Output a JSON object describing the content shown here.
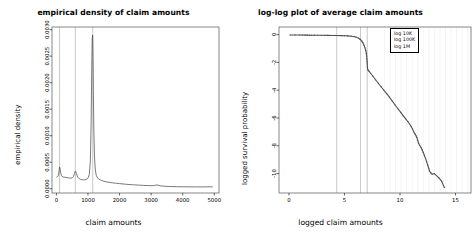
{
  "figure": {
    "width": 454,
    "height": 233,
    "background": "#ffffff",
    "foreground": "#000000",
    "curve_color": "#4d4d4d",
    "refline_color": "#b0b0b0",
    "grid_color": "#e8e8e8"
  },
  "panels": [
    {
      "id": "density-panel",
      "title": "empirical density of claim amounts",
      "xlabel": "claim amounts",
      "ylabel": "empirical density"
    },
    {
      "id": "loglog-panel",
      "title": "log-log plot of average claim amounts",
      "xlabel": "logged claim amounts",
      "ylabel": "logged survival probability",
      "legend": {
        "items": [
          "log 10K",
          "log 100K",
          "log 1M"
        ]
      }
    }
  ],
  "chart_data": [
    {
      "type": "line",
      "id": "density-panel",
      "title": "empirical density of claim amounts",
      "xlabel": "claim amounts",
      "ylabel": "empirical density",
      "xlim": [
        -140,
        5150
      ],
      "ylim": [
        -8e-05,
        0.00305
      ],
      "xticks": [
        0,
        1000,
        2000,
        3000,
        4000,
        5000
      ],
      "xticklabels": [
        "0",
        "1000",
        "2000",
        "3000",
        "4000",
        "5000"
      ],
      "yticks": [
        0.0,
        0.0005,
        0.001,
        0.0015,
        0.002,
        0.0025,
        0.003
      ],
      "yticklabels": [
        "0.0000",
        "0.0005",
        "0.0010",
        "0.0015",
        "0.0020",
        "0.0025",
        "0.0030"
      ],
      "grid": false,
      "legend_position": "none",
      "reference_lines_x": [
        100,
        600,
        1150
      ],
      "series": [
        {
          "name": "empirical density",
          "x": [
            0,
            30,
            55,
            75,
            90,
            100,
            110,
            125,
            140,
            160,
            185,
            210,
            240,
            270,
            300,
            340,
            380,
            420,
            460,
            500,
            540,
            570,
            590,
            600,
            615,
            635,
            660,
            690,
            720,
            760,
            800,
            850,
            900,
            950,
            1000,
            1040,
            1075,
            1100,
            1118,
            1132,
            1145,
            1152,
            1160,
            1170,
            1185,
            1205,
            1230,
            1260,
            1300,
            1350,
            1420,
            1500,
            1600,
            1700,
            1800,
            1900,
            2000,
            2150,
            2300,
            2450,
            2600,
            2750,
            2900,
            3000,
            3080,
            3140,
            3180,
            3220,
            3280,
            3400,
            3600,
            3800,
            4000,
            4200,
            4400,
            4600,
            4800,
            4950
          ],
          "y": [
            0.000215,
            0.000225,
            0.000245,
            0.0003,
            0.00037,
            0.00041,
            0.000395,
            0.00034,
            0.00029,
            0.000248,
            0.000228,
            0.00022,
            0.000218,
            0.000216,
            0.000214,
            0.00021,
            0.000206,
            0.000202,
            0.0002,
            0.000205,
            0.00023,
            0.000285,
            0.000325,
            0.000333,
            0.00032,
            0.000282,
            0.00024,
            0.000208,
            0.00019,
            0.000178,
            0.000172,
            0.000168,
            0.000168,
            0.000176,
            0.0002,
            0.000265,
            0.00052,
            0.00125,
            0.0022,
            0.00282,
            0.0029,
            0.00283,
            0.0025,
            0.00185,
            0.00112,
            0.00062,
            0.00037,
            0.000255,
            0.000205,
            0.00018,
            0.000158,
            0.000142,
            0.000128,
            0.000118,
            0.00011,
            0.000103,
            9.7e-05,
            8.8e-05,
            8e-05,
            7.4e-05,
            6.9e-05,
            6.4e-05,
            6e-05,
            5.8e-05,
            6e-05,
            6.8e-05,
            7.2e-05,
            6.6e-05,
            5.6e-05,
            4.8e-05,
            4.2e-05,
            3.9e-05,
            3.7e-05,
            3.6e-05,
            3.5e-05,
            3.5e-05,
            3.6e-05,
            3.7e-05
          ]
        }
      ]
    },
    {
      "type": "scatter",
      "id": "loglog-panel",
      "title": "log-log plot of average claim amounts",
      "xlabel": "logged claim amounts",
      "ylabel": "logged survival probability",
      "xlim": [
        -0.9,
        16.4
      ],
      "ylim": [
        -11.4,
        0.55
      ],
      "xticks": [
        0,
        5,
        10,
        15
      ],
      "xticklabels": [
        "0",
        "5",
        "10",
        "15"
      ],
      "yticks": [
        0,
        -2,
        -4,
        -6,
        -8,
        -10
      ],
      "yticklabels": [
        "0",
        "-2",
        "-4",
        "-6",
        "-8",
        "-10"
      ],
      "grid": true,
      "legend_position": "top-right",
      "legend_entries": [
        "log 10K",
        "log 100K",
        "log 1M"
      ],
      "reference_lines_x": [
        4.3,
        6.45,
        7.05
      ],
      "series": [
        {
          "name": "logged survival probability",
          "x": [
            0.1,
            0.55,
            0.95,
            1.2,
            1.45,
            1.65,
            1.85,
            2.05,
            2.3,
            2.6,
            2.9,
            3.2,
            3.5,
            3.8,
            4.1,
            4.4,
            4.7,
            5.0,
            5.3,
            5.6,
            5.85,
            6.05,
            6.25,
            6.4,
            6.55,
            6.65,
            6.75,
            6.85,
            6.92,
            6.97,
            7.0,
            7.02,
            7.04,
            7.05,
            7.06,
            7.08,
            7.12,
            7.2,
            7.35,
            7.55,
            7.8,
            8.05,
            8.3,
            8.55,
            8.8,
            9.05,
            9.3,
            9.55,
            9.8,
            10.05,
            10.3,
            10.5,
            10.7,
            10.85,
            11.0,
            11.12,
            11.25,
            11.35,
            11.45,
            11.52,
            11.6,
            11.68,
            11.78,
            11.9,
            12.0,
            12.1,
            12.2,
            12.3,
            12.4,
            12.5,
            12.6,
            12.68,
            12.78,
            12.9,
            13.1,
            13.55,
            13.75,
            14.0
          ],
          "y": [
            -0.02,
            -0.025,
            -0.03,
            -0.032,
            -0.034,
            -0.036,
            -0.038,
            -0.04,
            -0.042,
            -0.045,
            -0.048,
            -0.05,
            -0.053,
            -0.056,
            -0.06,
            -0.064,
            -0.07,
            -0.078,
            -0.09,
            -0.11,
            -0.14,
            -0.18,
            -0.25,
            -0.33,
            -0.45,
            -0.58,
            -0.75,
            -0.95,
            -1.15,
            -1.35,
            -1.55,
            -1.75,
            -1.95,
            -2.1,
            -2.3,
            -2.45,
            -2.55,
            -2.62,
            -2.78,
            -2.98,
            -3.25,
            -3.5,
            -3.75,
            -4.0,
            -4.25,
            -4.5,
            -4.78,
            -5.05,
            -5.32,
            -5.58,
            -5.85,
            -6.05,
            -6.25,
            -6.42,
            -6.6,
            -6.78,
            -7.0,
            -7.15,
            -7.28,
            -7.4,
            -7.62,
            -7.82,
            -7.98,
            -8.12,
            -8.3,
            -8.48,
            -8.7,
            -8.9,
            -9.15,
            -9.4,
            -9.65,
            -9.85,
            -9.95,
            -10.05,
            -10.0,
            -10.35,
            -10.55,
            -11.0
          ]
        }
      ]
    }
  ]
}
